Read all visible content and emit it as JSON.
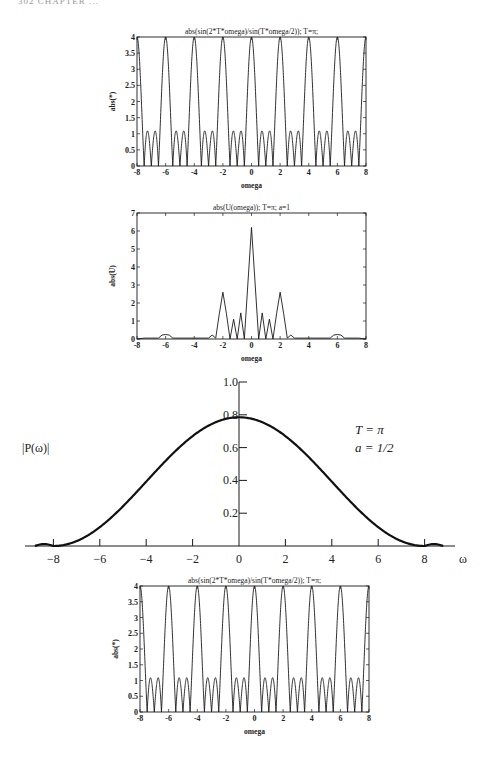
{
  "page": {
    "header": "302  CHAPTER ..."
  },
  "chart_data": [
    {
      "id": "top",
      "type": "line",
      "title": "abs(sin(2*T*omega)/sin(T*omega/2)); T=π;",
      "xlabel": "omega",
      "ylabel": "abs(*)",
      "xlim": [
        -8,
        8
      ],
      "ylim": [
        0,
        4
      ],
      "xticks": [
        "-8",
        "-6",
        "-4",
        "-2",
        "0",
        "2",
        "4",
        "6",
        "8"
      ],
      "yticks": [
        "0",
        "0.5",
        "1",
        "1.5",
        "2",
        "2.5",
        "3",
        "3.5",
        "4"
      ],
      "function": "abs(sin(2*pi*w)/sin(pi*w/2))",
      "grid": false,
      "peaks": {
        "x": [
          -8,
          -6,
          -4,
          -2,
          0,
          2,
          4,
          6,
          8
        ],
        "y": [
          4,
          4,
          4,
          4,
          4,
          4,
          4,
          4,
          4
        ]
      },
      "sidelobe_height": 1.08,
      "zeros_step": 0.5
    },
    {
      "id": "middle",
      "type": "line",
      "title": "abs(U(omega)); T=π; a=1",
      "xlabel": "omega",
      "ylabel": "abs(U)",
      "xlim": [
        -8,
        8
      ],
      "ylim": [
        0,
        7
      ],
      "xticks": [
        "-8",
        "-6",
        "-4",
        "-2",
        "0",
        "2",
        "4",
        "6",
        "8"
      ],
      "yticks": [
        "0",
        "1",
        "2",
        "3",
        "4",
        "5",
        "6",
        "7"
      ],
      "grid": false,
      "x": [
        -8,
        -7.5,
        -6.5,
        -6.25,
        -6,
        -5.75,
        -5.5,
        -4,
        -3,
        -2.75,
        -2.5,
        -2.25,
        -2,
        -1.75,
        -1.5,
        -1.25,
        -1,
        -0.75,
        -0.5,
        0,
        0.5,
        0.75,
        1,
        1.25,
        1.5,
        1.75,
        2,
        2.25,
        2.5,
        2.75,
        3,
        4,
        5.5,
        5.75,
        6,
        6.25,
        6.5,
        7.5,
        8
      ],
      "y": [
        0,
        0.05,
        0.05,
        0.22,
        0.25,
        0.22,
        0.05,
        0.05,
        0.05,
        0.22,
        0.05,
        1.4,
        2.6,
        1.4,
        0,
        1.1,
        0,
        1.45,
        0,
        6.2,
        0,
        1.45,
        0,
        1.1,
        0,
        1.4,
        2.6,
        1.4,
        0.05,
        0.22,
        0.05,
        0.05,
        0.05,
        0.22,
        0.25,
        0.22,
        0.05,
        0.05,
        0
      ]
    },
    {
      "id": "big",
      "type": "line",
      "ylabel": "|P(ω)|",
      "xlabel": "ω",
      "xlim": [
        -9,
        9
      ],
      "ylim": [
        0,
        1.0
      ],
      "xticks": [
        "−8",
        "−6",
        "−4",
        "−2",
        "0",
        "2",
        "4",
        "6",
        "8"
      ],
      "yticks": [
        "0.2",
        "0.4",
        "0.6",
        "0.8",
        "1.0"
      ],
      "annotations": [
        "T = π",
        "a = 1/2"
      ],
      "grid": false,
      "x": [
        -9,
        -8,
        -7,
        -6,
        -5,
        -4,
        -3,
        -2,
        -1,
        0,
        1,
        2,
        3,
        4,
        5,
        6,
        7,
        8,
        9
      ],
      "y": [
        0.01,
        0,
        0.02,
        0.07,
        0.15,
        0.27,
        0.41,
        0.55,
        0.7,
        0.785,
        0.7,
        0.55,
        0.41,
        0.27,
        0.15,
        0.07,
        0.02,
        0,
        0.01
      ]
    },
    {
      "id": "bottom",
      "type": "line",
      "title": "abs(sin(2*T*omega)/sin(T*omega/2)); T=π;",
      "xlabel": "omega",
      "ylabel": "abs(*)",
      "xlim": [
        -8,
        8
      ],
      "ylim": [
        0,
        4
      ],
      "xticks": [
        "-8",
        "-6",
        "-4",
        "-2",
        "0",
        "2",
        "4",
        "6",
        "8"
      ],
      "yticks": [
        "0",
        "0.5",
        "1",
        "1.5",
        "2",
        "2.5",
        "3",
        "3.5",
        "4"
      ],
      "function": "abs(sin(2*pi*w)/sin(pi*w/2))",
      "grid": false,
      "peaks": {
        "x": [
          -8,
          -6,
          -4,
          -2,
          0,
          2,
          4,
          6,
          8
        ],
        "y": [
          4,
          4,
          4,
          4,
          4,
          4,
          4,
          4,
          4
        ]
      },
      "sidelobe_height": 1.08,
      "zeros_step": 0.5
    }
  ],
  "layout": {
    "line_color": "#1a1a1a",
    "big_line_color": "#111111"
  }
}
